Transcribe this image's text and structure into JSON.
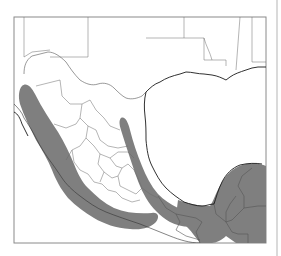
{
  "figure": {
    "type": "range-map",
    "region": "Mexico, Central America and US Gulf Coast",
    "frame": {
      "x": 14,
      "y": 17,
      "width": 252,
      "height": 226,
      "stroke": "#8a8a8a"
    },
    "side_rule": {
      "x": 277,
      "y1": 0,
      "y2": 256,
      "color": "#b5b5b5"
    },
    "colors": {
      "background": "#ffffff",
      "range_fill": "#7f7f7f",
      "border": "#555555",
      "coastline": "#1a1a1a"
    },
    "legend": null,
    "labels": []
  },
  "paths": {
    "range_pacific": "M22,86 C26,82 31,86 35,94 C42,108 50,120 58,132 C64,142 70,154 74,164 C78,174 82,182 88,188 C96,196 104,203 114,208 C126,213 140,214 152,213 C158,212 160,217 156,222 C150,228 142,230 130,229 C116,228 104,224 94,218 C84,212 76,206 68,198 C60,188 56,180 52,170 C48,160 42,150 36,140 C30,128 24,116 20,104 C18,96 19,89 22,86 Z",
    "range_sierra_oriental": "M121,118 C125,116 128,122 130,130 C133,142 137,154 142,166 C146,176 151,186 158,194 C164,200 170,204 178,208 C186,212 194,212 200,210 L206,212 C208,218 204,224 196,226 C188,228 178,226 170,222 C160,216 152,208 146,198 C140,188 136,176 132,164 C128,152 124,140 121,130 C119,124 119,120 121,118 Z",
    "range_yucatan": "M178,200 C190,204 200,206 210,206 C214,200 216,192 222,182 C228,172 236,166 246,164 C254,163 262,164 266,166 L266,243 L236,243 L226,236 C222,240 216,243 212,243 L200,243 C196,238 192,232 188,228 C184,224 180,220 176,216 Z",
    "coast_gulf_us": "M146,92 C150,88 154,84 160,82 C166,78 172,76 180,74 L186,72 C192,72 198,74 204,74 L212,75 C218,76 222,78 226,80 L230,77 C234,74 240,72 246,70 L252,68 L258,67 L266,67",
    "coast_gulf_mx": "M146,92 C144,100 144,108 145,116 C146,124 146,132 146,140 C147,150 148,158 152,166 C156,174 160,182 166,188 C172,194 178,198 184,202 C190,204 196,206 202,206 C206,206 210,204 214,204 C216,198 218,190 222,182 C226,174 232,168 240,165 C248,163 256,163 262,164",
    "coast_pacific": "M14,104 C18,108 22,112 24,118 C28,124 32,130 36,138 C40,146 44,152 48,158 C54,166 58,172 62,178 C66,184 72,190 80,196 C88,202 96,208 106,212 C116,216 128,220 140,224 C150,228 160,232 170,236 C180,240 190,243 200,243",
    "coast_baja": "M14,112 C18,114 20,118 22,124 C24,128 26,132 28,136",
    "border_us_mx": "M24,74 C24,66 26,60 32,56 L48,52 C54,52 60,56 66,62 C70,68 74,74 80,80 C86,84 92,86 98,84 C104,82 110,84 114,88 C118,92 122,96 126,98 C132,100 138,98 142,96 L146,92",
    "border_states_us": "M24,17 L24,57 M24,57 L32,52 L50,50 M88,17 L88,57 L50,57 M184,17 L184,38 L204,38 L204,60 L226,60 L226,66 M204,38 C206,46 210,52 212,60 M240,17 L236,70 M252,17 L252,62 L266,62 M184,38 L146,38",
    "border_states_mx": "M36,86 C44,84 52,82 60,80 M60,80 L62,96 L70,104 M70,104 L82,104 L90,100 M90,100 L96,110 L104,118 M104,118 L110,126 L120,130 M82,104 L80,118 L76,124 M76,124 L66,128 L54,124 M80,118 L88,126 L96,130 M96,130 L100,140 L108,146 M108,146 L118,148 L128,146 M88,126 L86,138 L80,146 M80,146 L72,150 L66,160 M86,138 L94,146 L100,154 M100,154 L98,164 L104,172 M104,172 L112,178 L118,176 M118,176 L122,168 L128,164 M128,164 L134,170 L138,178 M100,154 L110,158 L116,166 M116,166 L122,168 M110,158 L118,152 L128,152 M128,152 L134,158 M72,150 L74,162 L80,170 M80,170 L88,174 L94,182 M94,182 L102,184 L108,190 M108,190 L116,192 L122,198 M122,198 L132,202 L140,200 M138,178 L142,188 L150,194 M150,194 L158,198 M104,172 L100,182 M118,176 L120,186 L128,190 M128,190 L136,194 L142,188",
    "border_southeast": "M158,196 L166,208 L176,214 L186,216 M186,216 L196,218 L202,222 M202,222 L196,232 L200,243 M176,214 L180,222 L176,230 L186,236 L200,240 M214,204 L216,214 L226,222 L232,232 L238,234 M226,222 L232,220 L244,208 L244,196 L238,186 L242,176 L252,168 M244,208 L258,206 L266,206 M238,234 L248,234 L248,243",
    "border_yucatan_peninsula": "M226,222 L226,212 L230,204 L236,196"
  }
}
